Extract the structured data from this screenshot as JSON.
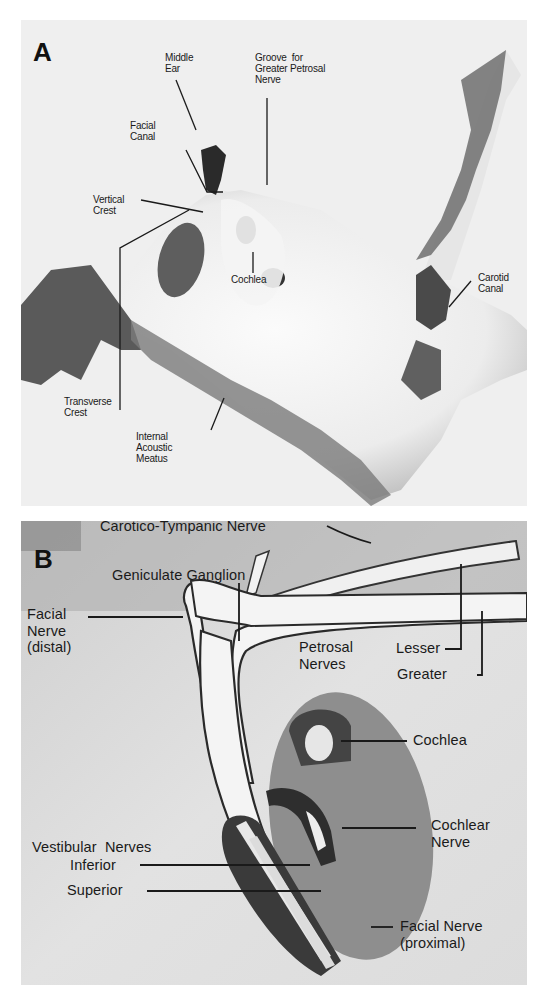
{
  "figure": {
    "panels": [
      {
        "id": "A",
        "letter": "A",
        "description": "Photograph of temporal bone, internal acoustic meatus region",
        "labels": {
          "middle_ear": "Middle\nEar",
          "groove": "Groove  for\nGreater Petrosal\nNerve",
          "facial_canal": "Facial\nCanal",
          "vertical_crest": "Vertical\nCrest",
          "cochlea": "Cochlea",
          "carotid_canal": "Carotid\nCanal",
          "transverse_crest": "Transverse\nCrest",
          "internal_acoustic_meatus": "Internal\nAcoustic\nMeatus"
        }
      },
      {
        "id": "B",
        "letter": "B",
        "description": "Illustration of facial, cochlear and vestibular nerves in the internal auditory canal",
        "labels": {
          "carotico_tympanic_nerve": "Carotico-Tympanic Nerve",
          "geniculate_ganglion": "Geniculate Ganglion",
          "facial_nerve_distal": "Facial\nNerve\n(distal)",
          "petrosal_nerves": "Petrosal\nNerves",
          "lesser": "Lesser",
          "greater": "Greater",
          "cochlea": "Cochlea",
          "cochlear_nerve": "Cochlear\nNerve",
          "vestibular_nerves": "Vestibular  Nerves",
          "inferior": "Inferior",
          "superior": "Superior",
          "facial_nerve_proximal": "Facial Nerve\n(proximal)"
        }
      }
    ]
  },
  "colors": {
    "background": "#ffffff",
    "panel_a_bg": "#efefef",
    "panel_b_bg": "#d6d6d6",
    "bone_shadow": "#555555",
    "label_text": "#1a1a1a",
    "leader_line": "#1a1a1a"
  }
}
